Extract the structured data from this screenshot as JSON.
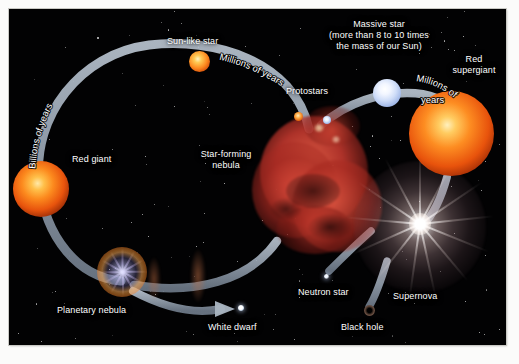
{
  "diagram": {
    "background_color": "#020203",
    "arrow_color": "#9aa6b4"
  },
  "stages": {
    "star_forming_nebula": "Star-forming\nnebula",
    "protostars": "Protostars",
    "sun_like_star": "Sun-like star",
    "red_giant": "Red giant",
    "planetary_nebula": "Planetary nebula",
    "white_dwarf": "White dwarf",
    "massive_star": "Massive star\n(more than 8 to 10 times\nthe mass of our Sun)",
    "red_supergiant": "Red\nsupergiant",
    "supernova": "Supernova",
    "neutron_star": "Neutron star",
    "black_hole": "Black hole"
  },
  "timescales": {
    "billions_of_years": "Billions of years",
    "millions_of_years_low_mass": "Millions of years",
    "millions_of_years_high_mass": "Millions of\nyears",
    "millions_high_line1": "Millions of",
    "millions_high_line2": "years"
  },
  "colors": {
    "red_giant": "#f07a18",
    "supergiant": "#f58320",
    "massive_star": "#cfddf8",
    "nebula": "#c6392f",
    "supernova": "#ffffff",
    "label_text": "#ffffff"
  }
}
